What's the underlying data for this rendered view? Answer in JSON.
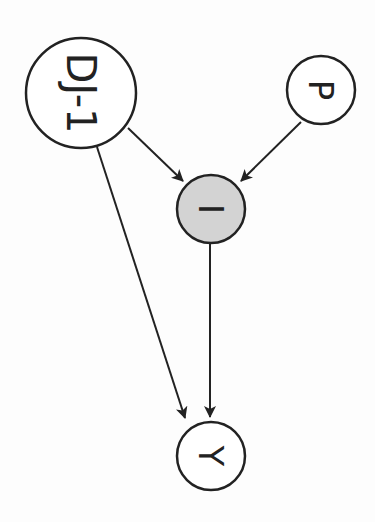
{
  "diagram": {
    "type": "causal-dag",
    "orientation": "rotated-90-clockwise",
    "colors": {
      "stroke": "#222222",
      "node_fill": "#ffffff",
      "highlight_fill": "#d3d3d3",
      "background": "#fdfdfd"
    },
    "nodes": [
      {
        "id": "DJ-1",
        "label": "DJ-1",
        "cx": 81,
        "cy": 93,
        "r": 55,
        "fill": "#ffffff",
        "font_size": 40
      },
      {
        "id": "P",
        "label": "P",
        "cx": 321,
        "cy": 90,
        "r": 34,
        "fill": "#ffffff",
        "font_size": 34
      },
      {
        "id": "I",
        "label": "I",
        "cx": 211,
        "cy": 209,
        "r": 34,
        "fill": "#d3d3d3",
        "font_size": 34
      },
      {
        "id": "Y",
        "label": "Y",
        "cx": 211,
        "cy": 456,
        "r": 34,
        "fill": "#ffffff",
        "font_size": 34
      }
    ],
    "edges": [
      {
        "from": "DJ-1",
        "to": "I",
        "x1": 128,
        "y1": 128,
        "x2": 183,
        "y2": 181
      },
      {
        "from": "P",
        "to": "I",
        "x1": 301,
        "y1": 122,
        "x2": 241,
        "y2": 181
      },
      {
        "from": "DJ-1",
        "to": "Y",
        "x1": 97,
        "y1": 147,
        "x2": 185,
        "y2": 418
      },
      {
        "from": "I",
        "to": "Y",
        "x1": 210,
        "y1": 243,
        "x2": 210,
        "y2": 417
      }
    ]
  }
}
